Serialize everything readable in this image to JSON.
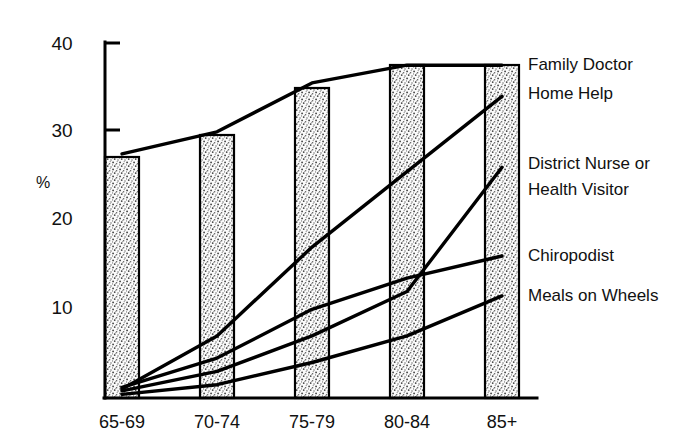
{
  "chart_data": {
    "type": "line",
    "title": "",
    "subtitle": "",
    "xlabel": "",
    "ylabel": "%",
    "categories": [
      "65-69",
      "70-74",
      "75-79",
      "80-84",
      "85+"
    ],
    "ylim": [
      0,
      40
    ],
    "yticks": [
      10,
      20,
      30,
      40
    ],
    "ytick_labels": [
      "10",
      "20",
      "30",
      "40"
    ],
    "grid": false,
    "legend_position": "right-inline-labels",
    "annotations": [
      "Shaded vertical bands mark each five-year age group",
      "Lines are labelled directly at the right edge"
    ],
    "series": [
      {
        "name": "Family Doctor",
        "values": [
          27.5,
          30.0,
          35.5,
          37.5,
          37.5
        ]
      },
      {
        "name": "Home Help",
        "values": [
          1.0,
          7.0,
          17.0,
          25.5,
          34.0
        ]
      },
      {
        "name": "District Nurse or Health Visitor",
        "values": [
          0.8,
          3.0,
          7.0,
          12.0,
          26.0
        ]
      },
      {
        "name": "Chiropodist",
        "values": [
          1.2,
          4.5,
          10.0,
          13.5,
          16.0
        ]
      },
      {
        "name": "Meals on Wheels",
        "values": [
          0.4,
          1.5,
          4.0,
          7.0,
          11.5
        ]
      }
    ]
  },
  "axis": {
    "y_label": "%",
    "tick_40": "40",
    "tick_30": "30",
    "tick_20": "20",
    "tick_10": "10"
  },
  "categories": {
    "c0": "65-69",
    "c1": "70-74",
    "c2": "75-79",
    "c3": "80-84",
    "c4": "85+"
  },
  "series_labels": {
    "family_doctor": "Family Doctor",
    "home_help": "Home Help",
    "district_nurse_line1": "District Nurse or",
    "district_nurse_line2": "Health Visitor",
    "chiropodist": "Chiropodist",
    "meals_on_wheels": "Meals on Wheels"
  },
  "colors": {
    "ink": "#000000",
    "band_fill": "#f2f2f2",
    "background": "#ffffff"
  }
}
